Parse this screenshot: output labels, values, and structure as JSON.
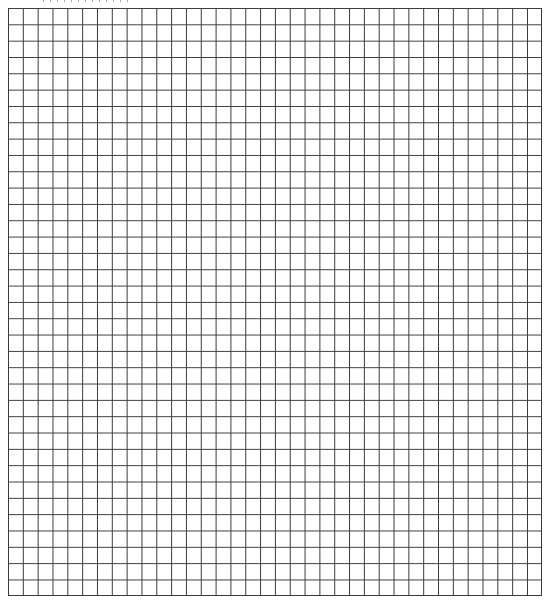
{
  "sheet": {
    "type": "graph-paper",
    "columns": 36,
    "rows": 36,
    "line_color": "#3a3a3a",
    "background_color": "#ffffff",
    "header_text_visible": false
  }
}
